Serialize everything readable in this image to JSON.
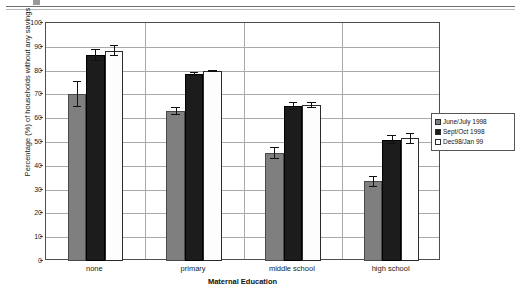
{
  "chart_data": {
    "type": "bar",
    "title": "",
    "xlabel": "Maternal Education",
    "ylabel": "Percentage (%) of households without any savings",
    "categories": [
      "none",
      "primary",
      "middle school",
      "high school"
    ],
    "ylim": [
      0,
      100
    ],
    "yticks": [
      0,
      10,
      20,
      30,
      40,
      50,
      60,
      70,
      80,
      90,
      100
    ],
    "ytick_labels": [
      "0",
      "10",
      "20",
      "30",
      "40",
      "50",
      "60",
      "70",
      "80",
      "90",
      "100"
    ],
    "grid": true,
    "legend_position": "right",
    "series": [
      {
        "name": "June/July 1998",
        "color": "#7f7f7f",
        "values": [
          70.3,
          63.0,
          45.5,
          33.5
        ],
        "errors": [
          5.4,
          1.6,
          2.5,
          2.3
        ]
      },
      {
        "name": "Sept/Oct 1998",
        "color": "#1c1c1c",
        "values": [
          86.6,
          78.5,
          65.0,
          51.0
        ],
        "errors": [
          2.6,
          0.9,
          1.6,
          2.0
        ]
      },
      {
        "name": "Dec98/Jan 99",
        "color": "#ffffff",
        "values": [
          88.4,
          79.8,
          65.5,
          51.5
        ],
        "errors": [
          2.3,
          0.6,
          1.4,
          2.2
        ]
      }
    ]
  },
  "legend": {
    "items": [
      {
        "label": "June/July 1998"
      },
      {
        "label": "Sept/Oct 1998"
      },
      {
        "label": "Dec98/Jan 99"
      }
    ]
  }
}
